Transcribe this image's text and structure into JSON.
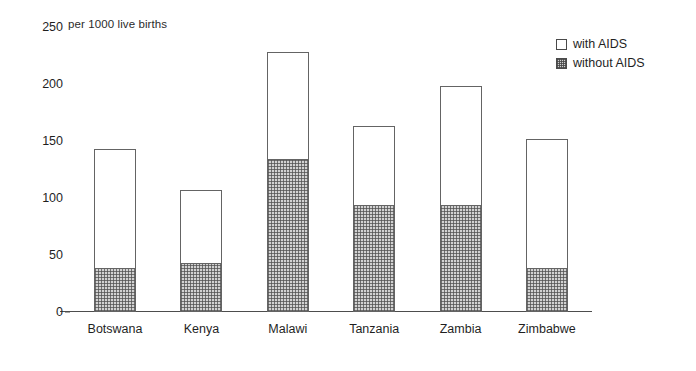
{
  "chart_data": {
    "type": "bar",
    "subtype": "stacked-vertical",
    "title": "",
    "unit_caption": "per 1000 live births",
    "xlabel": "",
    "ylabel": "",
    "ylim": [
      0,
      250
    ],
    "yticks": [
      0,
      50,
      100,
      150,
      200,
      250
    ],
    "ytick_labels": [
      "0",
      "50",
      "100",
      "150",
      "200",
      "250"
    ],
    "grid": false,
    "legend_position": "top-right",
    "categories": [
      "Botswana",
      "Kenya",
      "Malawi",
      "Tanzania",
      "Zambia",
      "Zimbabwe"
    ],
    "series": [
      {
        "name": "without AIDS",
        "fill": "hatched-grey",
        "values": [
          39,
          43,
          134,
          94,
          94,
          39
        ]
      },
      {
        "name": "with AIDS",
        "fill": "white",
        "note": "segment drawn above 'without AIDS'; totals are the stacked bar tops",
        "values": [
          104,
          64,
          94,
          69,
          104,
          113
        ]
      }
    ],
    "totals": [
      143,
      107,
      228,
      163,
      198,
      152
    ]
  },
  "legend": {
    "items": [
      {
        "label": "with AIDS",
        "swatch": "white-square"
      },
      {
        "label": "without AIDS",
        "swatch": "hatched-square"
      }
    ]
  },
  "colors": {
    "background": "#ffffff",
    "axis": "#4d4d4d",
    "bar_outline": "#646464",
    "with_aids_fill": "#ffffff",
    "without_aids_fill": "#d2d2d2",
    "text": "#1f1f1f"
  }
}
